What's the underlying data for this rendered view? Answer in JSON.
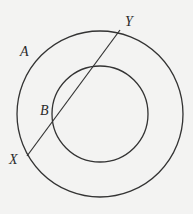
{
  "diagram": {
    "colors": {
      "background": "#f3f3f2",
      "stroke": "#333333",
      "text": "#2a2a2a"
    },
    "outer_circle": {
      "cx": 100,
      "cy": 114,
      "r": 83
    },
    "inner_circle": {
      "cx": 100,
      "cy": 114,
      "r": 48
    },
    "chord": {
      "x1": 27,
      "y1": 156,
      "x2": 120,
      "y2": 30
    },
    "labels": {
      "A": {
        "text": "A",
        "x": 20,
        "y": 56
      },
      "B": {
        "text": "B",
        "x": 40,
        "y": 115
      },
      "X": {
        "text": "X",
        "x": 9,
        "y": 164
      },
      "Y": {
        "text": "Y",
        "x": 125,
        "y": 26
      }
    }
  }
}
